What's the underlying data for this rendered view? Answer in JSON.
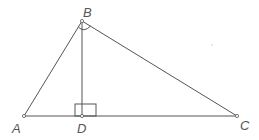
{
  "diagram": {
    "type": "geometry",
    "colors": {
      "line": "#555555",
      "label": "#555555",
      "background": "#ffffff"
    },
    "points": {
      "A": {
        "label": "A",
        "x": 24,
        "y": 116
      },
      "B": {
        "label": "B",
        "x": 82,
        "y": 21
      },
      "C": {
        "label": "C",
        "x": 237,
        "y": 116
      },
      "D": {
        "label": "D",
        "x": 82,
        "y": 116
      }
    },
    "segments": [
      {
        "from": "A",
        "to": "B"
      },
      {
        "from": "B",
        "to": "C"
      },
      {
        "from": "A",
        "to": "C"
      },
      {
        "from": "B",
        "to": "D"
      }
    ],
    "right_angles": [
      "B",
      "D"
    ],
    "labels": {
      "A": "A",
      "B": "B",
      "C": "C",
      "D": "D"
    }
  }
}
